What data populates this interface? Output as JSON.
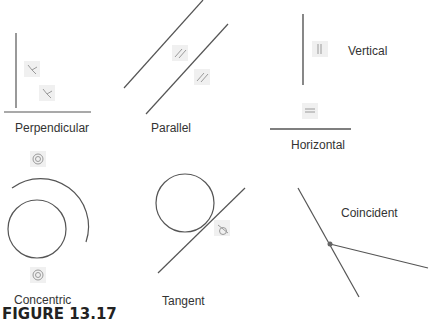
{
  "figure": {
    "caption": "FIGURE 13.17"
  },
  "constraints": [
    {
      "id": "perpendicular",
      "label": "Perpendicular",
      "icon": "perpendicular-icon"
    },
    {
      "id": "parallel",
      "label": "Parallel",
      "icon": "parallel-icon"
    },
    {
      "id": "vertical",
      "label": "Vertical",
      "icon": "vertical-icon"
    },
    {
      "id": "horizontal",
      "label": "Horizontal",
      "icon": "horizontal-icon"
    },
    {
      "id": "concentric",
      "label": "Concentric",
      "icon": "concentric-icon"
    },
    {
      "id": "tangent",
      "label": "Tangent",
      "icon": "tangent-icon"
    },
    {
      "id": "coincident",
      "label": "Coincident",
      "icon": "coincident-point"
    }
  ],
  "colors": {
    "line": "#555555",
    "badge_bg": "#f0f0f0",
    "badge_glyph": "#9a9a9a",
    "text": "#333333"
  }
}
